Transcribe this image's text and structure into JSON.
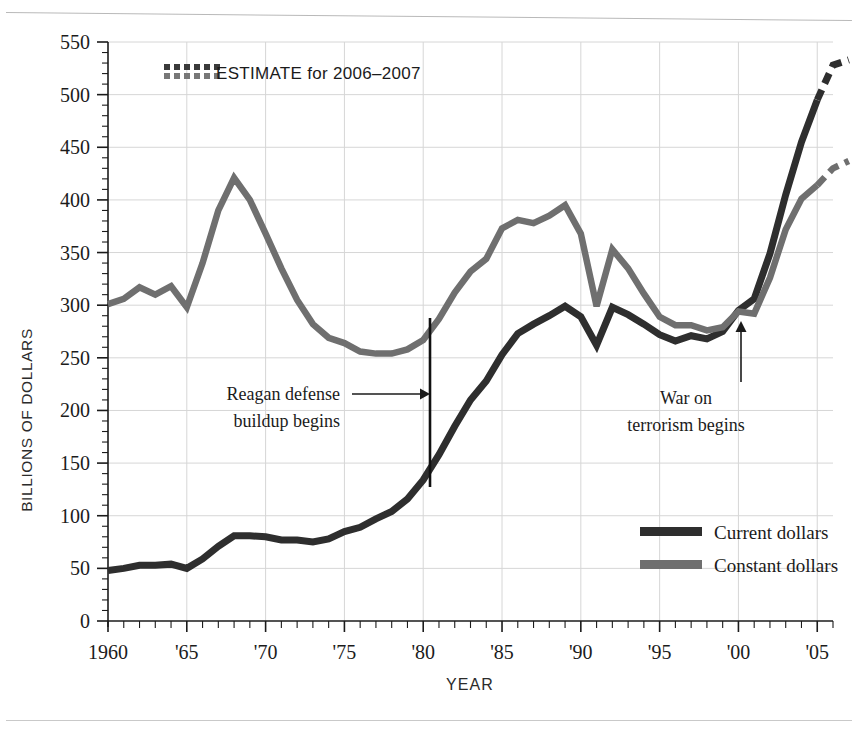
{
  "chart_data": {
    "type": "line",
    "title": "",
    "xlabel": "YEAR",
    "ylabel": "BILLIONS OF DOLLARS",
    "xlim": [
      1960,
      2007
    ],
    "ylim": [
      0,
      550
    ],
    "y_ticks": [
      0,
      50,
      100,
      150,
      200,
      250,
      300,
      350,
      400,
      450,
      500,
      550
    ],
    "y_tick_labels": [
      "0",
      "50",
      "100",
      "150",
      "200",
      "250",
      "300",
      "350",
      "400",
      "450",
      "500",
      "550"
    ],
    "y_minor_step": 10,
    "x_ticks": [
      1960,
      1965,
      1970,
      1975,
      1980,
      1985,
      1990,
      1995,
      2000,
      2005
    ],
    "x_tick_labels": [
      "1960",
      "'65",
      "'70",
      "'75",
      "'80",
      "'85",
      "'90",
      "'95",
      "'00",
      "'05"
    ],
    "x_minor_step": 1,
    "grid": true,
    "grid_color": "#d6d6d6",
    "legend_position": "bottom-right",
    "x": [
      1960,
      1961,
      1962,
      1963,
      1964,
      1965,
      1966,
      1967,
      1968,
      1969,
      1970,
      1971,
      1972,
      1973,
      1974,
      1975,
      1976,
      1977,
      1978,
      1979,
      1980,
      1981,
      1982,
      1983,
      1984,
      1985,
      1986,
      1987,
      1988,
      1989,
      1990,
      1991,
      1992,
      1993,
      1994,
      1995,
      1996,
      1997,
      1998,
      1999,
      2000,
      2001,
      2002,
      2003,
      2004,
      2005,
      2006,
      2007
    ],
    "series": [
      {
        "name": "Current dollars",
        "color": "#2e2e2e",
        "values": [
          48,
          50,
          53,
          53,
          54,
          50,
          59,
          71,
          81,
          81,
          80,
          77,
          77,
          75,
          78,
          85,
          89,
          97,
          104,
          116,
          134,
          158,
          185,
          210,
          228,
          253,
          273,
          282,
          290,
          299,
          289,
          262,
          298,
          291,
          282,
          272,
          266,
          271,
          268,
          275,
          295,
          306,
          349,
          405,
          455,
          495,
          528,
          533
        ]
      },
      {
        "name": "Constant dollars",
        "color": "#6f6f6f",
        "values": [
          301,
          306,
          317,
          310,
          318,
          298,
          340,
          390,
          421,
          400,
          368,
          335,
          305,
          282,
          269,
          264,
          256,
          254,
          254,
          258,
          267,
          287,
          312,
          332,
          344,
          373,
          381,
          378,
          385,
          395,
          368,
          299,
          353,
          335,
          311,
          289,
          281,
          281,
          276,
          279,
          294,
          292,
          326,
          372,
          401,
          414,
          430,
          437
        ]
      }
    ],
    "estimate_note": "ESTIMATE for 2006–2007",
    "estimate_years": [
      2006,
      2007
    ],
    "annotations": [
      {
        "name": "reagan-annotation",
        "line1": "Reagan defense",
        "line2": "buildup begins",
        "marker": "vertical-line",
        "marker_year": 1980.3,
        "arrow": "right"
      },
      {
        "name": "war-on-terror-annotation",
        "line1": "War on",
        "line2": "terrorism begins",
        "marker": "arrow",
        "marker_year": 2001,
        "arrow": "up"
      }
    ]
  },
  "legend": {
    "items": [
      {
        "label": "Current dollars",
        "color": "#2e2e2e"
      },
      {
        "label": "Constant dollars",
        "color": "#6f6f6f"
      }
    ]
  }
}
